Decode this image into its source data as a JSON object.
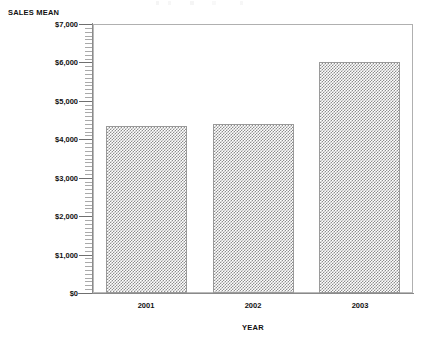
{
  "chart_data": {
    "type": "bar",
    "title": "",
    "xlabel": "YEAR",
    "ylabel": "SALES MEAN",
    "categories": [
      "2001",
      "2002",
      "2003"
    ],
    "values": [
      4350,
      4400,
      6020
    ],
    "ylim": [
      0,
      7000
    ],
    "ytick_values": [
      0,
      1000,
      2000,
      3000,
      4000,
      5000,
      6000,
      7000
    ],
    "ytick_labels": [
      "$0",
      "$1,000",
      "$2,000",
      "$3,000",
      "$4,000",
      "$5,000",
      "$6,000",
      "$7,000"
    ],
    "minor_tick_step": 100,
    "grid": false,
    "legend": null,
    "bar_fill": "checkerboard-hatch",
    "bar_fill_color": "#8e8e8e",
    "bar_edge_color": "#9a9a9a",
    "frame_color": "#b9b9b9",
    "axis_color": "#8a8a8a",
    "text_color": "#111111",
    "background": "#ffffff"
  },
  "axes": {
    "y_title": "SALES MEAN",
    "x_title": "YEAR"
  }
}
